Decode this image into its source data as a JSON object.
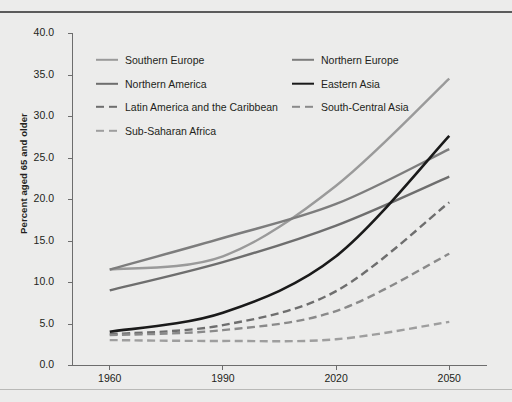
{
  "chart_data": {
    "type": "line",
    "title": "",
    "xlabel": "",
    "ylabel": "Percent aged 65 and older",
    "x": [
      1960,
      1990,
      2020,
      2050
    ],
    "xtick_labels": [
      "1960",
      "1990",
      "2020",
      "2050"
    ],
    "xlim": [
      1950,
      2060
    ],
    "ylim": [
      0.0,
      40.0
    ],
    "ytick_labels": [
      "0.0",
      "5.0",
      "10.0",
      "15.0",
      "20.0",
      "25.0",
      "30.0",
      "35.0",
      "40.0"
    ],
    "ytick_values": [
      0.0,
      5.0,
      10.0,
      15.0,
      20.0,
      25.0,
      30.0,
      35.0,
      40.0
    ],
    "grid": false,
    "legend_position": "upper-left-inside",
    "series": [
      {
        "name": "Southern Europe",
        "values": [
          11.5,
          13.1,
          21.6,
          34.5
        ],
        "color": "#9a9a9a",
        "style": "solid",
        "width": 2.4
      },
      {
        "name": "Northern Europe",
        "values": [
          11.5,
          15.3,
          19.4,
          26.0
        ],
        "color": "#7d7d7d",
        "style": "solid",
        "width": 2.4
      },
      {
        "name": "Northern America",
        "values": [
          9.0,
          12.4,
          16.8,
          22.7
        ],
        "color": "#6e6e6e",
        "style": "solid",
        "width": 2.4
      },
      {
        "name": "Eastern Asia",
        "values": [
          4.0,
          6.3,
          13.1,
          27.6
        ],
        "color": "#1a1a1a",
        "style": "solid",
        "width": 2.6
      },
      {
        "name": "Latin America and the Caribbean",
        "values": [
          3.7,
          4.8,
          8.9,
          19.6
        ],
        "color": "#6e6e6e",
        "style": "dashed",
        "width": 2.4
      },
      {
        "name": "South-Central Asia",
        "values": [
          3.6,
          4.2,
          6.5,
          13.4
        ],
        "color": "#8a8a8a",
        "style": "dashed",
        "width": 2.4
      },
      {
        "name": "Sub-Saharan Africa",
        "values": [
          3.0,
          2.9,
          3.1,
          5.2
        ],
        "color": "#9e9e9e",
        "style": "dashed",
        "width": 2.4
      }
    ]
  },
  "legend": {
    "rows": [
      [
        {
          "name": "Southern Europe"
        },
        {
          "name": "Northern Europe"
        }
      ],
      [
        {
          "name": "Northern America"
        },
        {
          "name": "Eastern Asia"
        }
      ],
      [
        {
          "name": "Latin America and the Caribbean"
        },
        {
          "name": "South-Central Asia"
        }
      ],
      [
        {
          "name": "Sub-Saharan Africa"
        }
      ]
    ]
  },
  "caption": ""
}
